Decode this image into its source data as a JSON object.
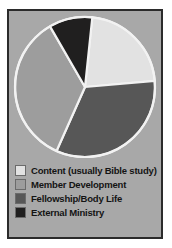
{
  "figure": {
    "background_color": "#a8a8a8",
    "border_color": "#2b2b2b",
    "page_background": "#ffffff"
  },
  "chart_data": {
    "type": "pie",
    "title": "",
    "subtitle": "",
    "xlabel": "",
    "ylabel": "",
    "grid": false,
    "legend_position": "bottom-left",
    "start_angle_deg": 6,
    "direction": "clockwise",
    "center": {
      "x": 76,
      "y": 76
    },
    "radius": 70,
    "slice_outline_color": "#f2f2f2",
    "categories": [
      "Content (usually Bible study)",
      "Fellowship/Body Life",
      "Member Development",
      "External Ministry"
    ],
    "values": [
      22,
      33,
      35,
      10
    ],
    "colors": [
      "#e2e2e2",
      "#575757",
      "#9d9d9d",
      "#201f1f"
    ],
    "slices": [
      {
        "label": "Content (usually Bible study)",
        "value": 22,
        "color": "#e2e2e2",
        "start_deg": 6,
        "end_deg": 85
      },
      {
        "label": "Fellowship/Body Life",
        "value": 33,
        "color": "#575757",
        "start_deg": 85,
        "end_deg": 204
      },
      {
        "label": "Member Development",
        "value": 35,
        "color": "#9d9d9d",
        "start_deg": 204,
        "end_deg": 330
      },
      {
        "label": "External Ministry",
        "value": 10,
        "color": "#201f1f",
        "start_deg": 330,
        "end_deg": 366
      }
    ]
  },
  "legend": {
    "items": [
      {
        "label": "Content (usually Bible study)",
        "color": "#e2e2e2"
      },
      {
        "label": "Member Development",
        "color": "#9d9d9d"
      },
      {
        "label": "Fellowship/Body Life",
        "color": "#575757"
      },
      {
        "label": "External Ministry",
        "color": "#201f1f"
      }
    ]
  }
}
